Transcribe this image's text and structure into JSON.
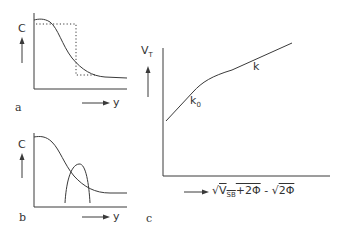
{
  "panels": {
    "a": {
      "label": "a",
      "y_axis_label": "C",
      "x_axis_label": "y",
      "description": "Doping profile C(y) with box (dotted) approximation"
    },
    "b": {
      "label": "b",
      "y_axis_label": "C",
      "x_axis_label": "y",
      "description": "Doping profile C(y) with overlapping bell-shaped distribution"
    },
    "c": {
      "label": "c",
      "y_axis_label": "V",
      "y_axis_label_sub": "T",
      "x_axis_label_prefix": "√",
      "x_axis_label_term1": "V",
      "x_axis_label_term1_sub": "SB",
      "x_axis_label_term1_rest": "+2Φ",
      "x_axis_label_minus": " - √",
      "x_axis_label_term2": "2Φ",
      "slope_initial": "k",
      "slope_initial_sub": "0",
      "slope_final": "k",
      "description": "Threshold voltage vs body-effect term"
    }
  },
  "colors": {
    "line": "#3a3a3a",
    "background": "#ffffff"
  }
}
